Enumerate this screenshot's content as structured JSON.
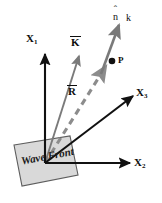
{
  "figure": {
    "background_color": "#ffffff",
    "axis_color": "#111111",
    "vector_color": "#7a7a7a",
    "dashed_color": "#8c8c8c",
    "plane_fill": "#d8d8d8",
    "plane_stroke": "#5a5a5a",
    "point_color": "#111111"
  },
  "axes": [
    {
      "name": "x1",
      "label": "X",
      "subscript": "1",
      "direction": "up",
      "origin": [
        45,
        163
      ],
      "tip": [
        45,
        52
      ]
    },
    {
      "name": "x2",
      "label": "X",
      "subscript": "2",
      "direction": "right",
      "origin": [
        45,
        163
      ],
      "tip": [
        131,
        163
      ]
    },
    {
      "name": "x3",
      "label": "X",
      "subscript": "3",
      "direction": "up-right",
      "origin": [
        45,
        163
      ],
      "tip": [
        134,
        95
      ]
    }
  ],
  "vectors": [
    {
      "name": "k-vector",
      "label": "K",
      "overbar": true,
      "style": "solid",
      "color": "#7a7a7a",
      "origin": [
        45,
        163
      ],
      "tip": [
        79,
        55
      ]
    },
    {
      "name": "r-vector",
      "label": "R",
      "overbar": true,
      "style": "dashed",
      "color": "#8c8c8c",
      "origin": [
        45,
        163
      ],
      "tip": [
        106,
        66
      ]
    },
    {
      "name": "n-hat-vector",
      "label": "n",
      "hat": true,
      "style": "solid",
      "color": "#7a7a7a",
      "origin": [
        102,
        73
      ],
      "tip": [
        120,
        23
      ]
    }
  ],
  "point": {
    "name": "point-p",
    "label": "P",
    "position": [
      112,
      61
    ]
  },
  "wave_number_label": {
    "name": "k-scalar",
    "label": "k",
    "position": [
      131,
      16
    ]
  },
  "plane": {
    "name": "wave-front-plane",
    "label": "Wave Front",
    "rotation_deg": -11,
    "corners": [
      [
        14,
        145
      ],
      [
        70,
        136
      ],
      [
        78,
        175
      ],
      [
        22,
        186
      ]
    ]
  },
  "labels": {
    "x1": "X",
    "x1_sub": "1",
    "x2": "X",
    "x2_sub": "2",
    "x3": "X",
    "x3_sub": "3",
    "k_vector": "K",
    "r_vector": "R",
    "n_hat": "n",
    "n_hat_caret": "ˆ",
    "k_scalar": "k",
    "point_p": "P",
    "wave_front": "Wave Front"
  }
}
